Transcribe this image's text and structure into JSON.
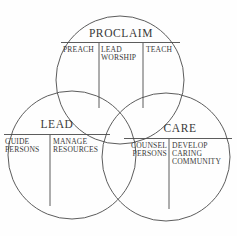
{
  "diagram": {
    "type": "venn-three-circle",
    "background_color": "#fefefe",
    "line_color": "#4a4a4a",
    "text_color": "#3a3a3a",
    "circles": [
      {
        "id": "proclaim",
        "title": "PROCLAIM",
        "segments": [
          {
            "id": "preach",
            "text": "PREACH"
          },
          {
            "id": "lead-worship",
            "text": "LEAD\nWORSHIP"
          },
          {
            "id": "teach",
            "text": "TEACH"
          }
        ]
      },
      {
        "id": "lead",
        "title": "LEAD",
        "segments": [
          {
            "id": "guide-persons",
            "text": "GUIDE\nPERSONS"
          },
          {
            "id": "manage-resources",
            "text": "MANAGE\nRESOURCES"
          }
        ]
      },
      {
        "id": "care",
        "title": "CARE",
        "segments": [
          {
            "id": "counsel-persons",
            "text": "COUNSEL\nPERSONS"
          },
          {
            "id": "develop-caring-community",
            "text": "DEVELOP\nCARING\nCOMMUNITY"
          }
        ]
      }
    ]
  }
}
